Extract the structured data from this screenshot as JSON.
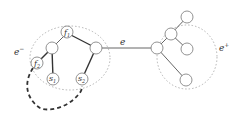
{
  "diagram": {
    "left_cluster": {
      "label": "e",
      "label_sup": "−"
    },
    "right_cluster": {
      "label": "e",
      "label_sup": "+"
    },
    "bridge_edge": {
      "label": "e"
    },
    "left_nodes": [
      {
        "id": "f1",
        "label": "f",
        "sub": "1"
      },
      {
        "id": "f2",
        "label": "f",
        "sub": "2"
      },
      {
        "id": "s1",
        "label": "s",
        "sub": "1"
      },
      {
        "id": "s2",
        "label": "s",
        "sub": "2"
      },
      {
        "id": "a",
        "label": ""
      },
      {
        "id": "b",
        "label": ""
      }
    ],
    "right_nodes_count": 5,
    "dashed_path": {
      "from": "f2",
      "to": "s2",
      "style": "dashed"
    },
    "colors": {
      "stroke": "#333333",
      "node_stroke": "#777777",
      "cluster": "#aaaaaa"
    }
  }
}
